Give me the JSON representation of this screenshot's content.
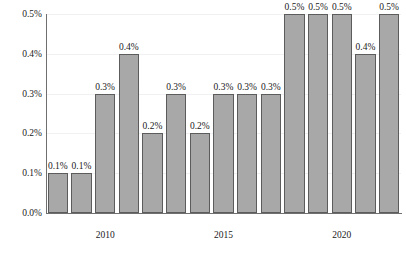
{
  "chart_data": {
    "type": "bar",
    "title": "",
    "subtitle": "",
    "xlabel": "",
    "ylabel": "",
    "categories": [
      "2008",
      "2009",
      "2010",
      "2011",
      "2012",
      "2013",
      "2014",
      "2015",
      "2016",
      "2017",
      "2018",
      "2019",
      "2020",
      "2021",
      "2022"
    ],
    "values": [
      0.1,
      0.1,
      0.3,
      0.4,
      0.2,
      0.3,
      0.2,
      0.3,
      0.3,
      0.3,
      0.5,
      0.5,
      0.5,
      0.4,
      0.5
    ],
    "bar_labels": [
      "0.1%",
      "0.1%",
      "0.3%",
      "0.4%",
      "0.2%",
      "0.3%",
      "0.2%",
      "0.3%",
      "0.3%",
      "0.3%",
      "0.5%",
      "0.5%",
      "0.5%",
      "0.4%",
      "0.5%"
    ],
    "ylim": [
      0.0,
      0.5
    ],
    "y_ticks": [
      0.0,
      0.1,
      0.2,
      0.3,
      0.4,
      0.5
    ],
    "y_tick_labels": [
      "0.0%",
      "0.1%",
      "0.2%",
      "0.3%",
      "0.4%",
      "0.5%"
    ],
    "x_ticks": [
      "2010",
      "2015",
      "2020"
    ],
    "x_tick_categories": [
      "2010",
      "2015",
      "2020"
    ],
    "grid": true,
    "legend": "none",
    "colors": {
      "bar_fill": "#a8a8a8",
      "bar_stroke": "#5c5c5c",
      "gridline": "#f1f1f4",
      "axis": "#6f6f6f",
      "text": "#1a1a1a",
      "background": "#ffffff"
    }
  }
}
